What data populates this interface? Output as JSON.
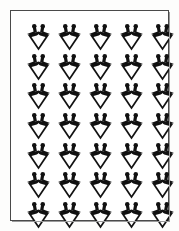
{
  "artwork": {
    "title": "Repeating Kite Motif Pattern Plate",
    "description": "Monochrome decorative plate with a rectangular ruled border enclosing a regular grid of identical black ornamental motifs.",
    "background_color": "#ffffff",
    "page_color": "#fdfdfc",
    "ink_color": "#111111",
    "frame_color": "#4a4a4a",
    "frame_shadow_color": "#9a9a9a"
  },
  "frame": {
    "name": "plate-border",
    "shape": "rectangle",
    "stroke_width_px": 1.5
  },
  "grid": {
    "columns": 5,
    "rows": 7,
    "total_motifs": 35,
    "arrangement": "aligned",
    "motif_width_px": 25,
    "motif_height_px": 27,
    "column_pitch_px": 31,
    "row_pitch_px": 29.5
  },
  "motif": {
    "name": "kite-diamond-ornament",
    "orientation": "point-down",
    "fill": "#111111",
    "parts": [
      "left-ball-finial",
      "right-ball-finial",
      "left-stem",
      "right-stem",
      "left-wing",
      "right-wing",
      "diamond-body",
      "inner-white-diamond"
    ]
  },
  "motif_labels": [
    "motif-r1c1",
    "motif-r1c2",
    "motif-r1c3",
    "motif-r1c4",
    "motif-r1c5",
    "motif-r2c1",
    "motif-r2c2",
    "motif-r2c3",
    "motif-r2c4",
    "motif-r2c5",
    "motif-r3c1",
    "motif-r3c2",
    "motif-r3c3",
    "motif-r3c4",
    "motif-r3c5",
    "motif-r4c1",
    "motif-r4c2",
    "motif-r4c3",
    "motif-r4c4",
    "motif-r4c5",
    "motif-r5c1",
    "motif-r5c2",
    "motif-r5c3",
    "motif-r5c4",
    "motif-r5c5",
    "motif-r6c1",
    "motif-r6c2",
    "motif-r6c3",
    "motif-r6c4",
    "motif-r6c5",
    "motif-r7c1",
    "motif-r7c2",
    "motif-r7c3",
    "motif-r7c4",
    "motif-r7c5"
  ]
}
